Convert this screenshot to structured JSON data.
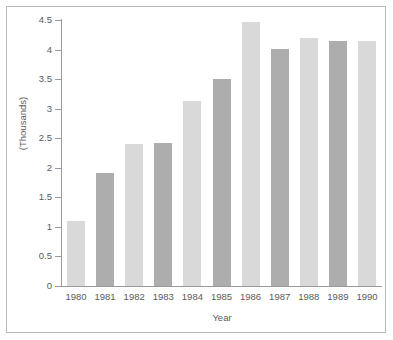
{
  "chart_data": {
    "type": "bar",
    "title": "",
    "xlabel": "Year",
    "ylabel": "(Thousands)",
    "categories": [
      "1980",
      "1981",
      "1982",
      "1983",
      "1984",
      "1985",
      "1986",
      "1987",
      "1988",
      "1989",
      "1990"
    ],
    "values": [
      1.1,
      1.92,
      2.4,
      2.42,
      3.13,
      3.5,
      4.47,
      4.01,
      4.2,
      4.14,
      4.14
    ],
    "ylim": [
      0,
      4.5
    ],
    "yticks": [
      "0",
      "0.5",
      "1",
      "1.5",
      "2",
      "2.5",
      "3",
      "3.5",
      "4",
      "4.5"
    ],
    "ytick_values": [
      0,
      0.5,
      1,
      1.5,
      2,
      2.5,
      3,
      3.5,
      4,
      4.5
    ],
    "grid": false,
    "legend": "none",
    "bar_colors": [
      "#d9d9d9",
      "#adadad",
      "#d9d9d9",
      "#adadad",
      "#d9d9d9",
      "#adadad",
      "#d9d9d9",
      "#adadad",
      "#d9d9d9",
      "#adadad",
      "#d9d9d9"
    ],
    "colors": {
      "bar_light": "#d9d9d9",
      "bar_dark": "#adadad",
      "axis": "#9a9a9a",
      "text": "#5b5b5b",
      "border": "#b9b9b9",
      "background": "#ffffff"
    }
  }
}
